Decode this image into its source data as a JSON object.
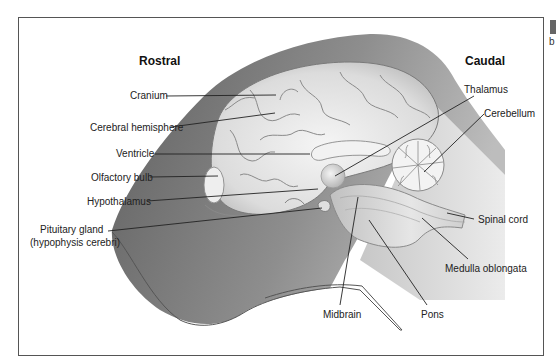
{
  "diagram": {
    "type": "anatomical-sagittal-section",
    "directions": {
      "rostral": "Rostral",
      "caudal": "Caudal"
    },
    "labels": {
      "cranium": "Cranium",
      "cerebral_hemisphere": "Cerebral hemisphere",
      "ventricle": "Ventricle",
      "olfactory_bulb": "Olfactory bulb",
      "hypothalamus": "Hypothalamus",
      "pituitary_line1": "Pituitary gland",
      "pituitary_line2": "(hypophysis cerebri)",
      "thalamus": "Thalamus",
      "cerebellum": "Cerebellum",
      "spinal_cord": "Spinal cord",
      "medulla_oblongata": "Medulla oblongata",
      "pons": "Pons",
      "midbrain": "Midbrain"
    },
    "colors": {
      "head_dark": "#6e6e6e",
      "head_mid": "#9a9a9a",
      "brain_light": "#e6e6e6",
      "neck_light": "#c8c8c8"
    }
  },
  "page_edge": {
    "letter": "b"
  }
}
